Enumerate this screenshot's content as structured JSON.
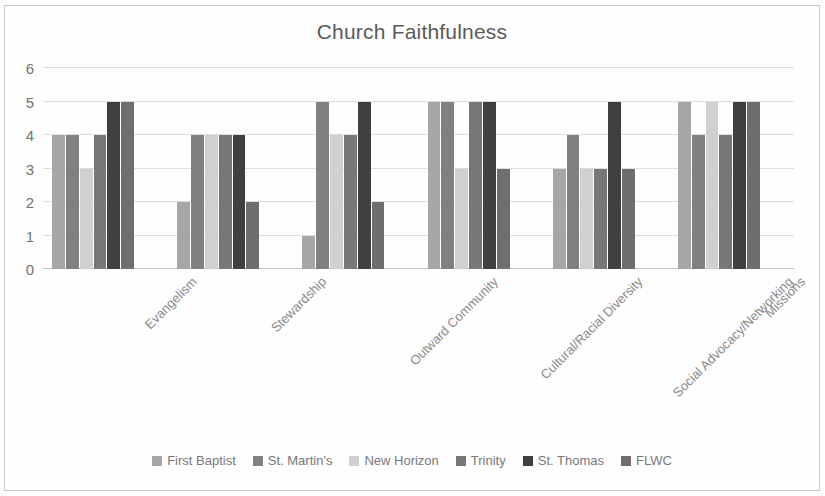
{
  "chart_data": {
    "type": "bar",
    "title": "Church Faithfulness",
    "xlabel": "",
    "ylabel": "",
    "ylim": [
      0,
      6
    ],
    "yticks": [
      0,
      1,
      2,
      3,
      4,
      5,
      6
    ],
    "grid": true,
    "legend_position": "bottom",
    "categories": [
      "Evangelism",
      "Stewardship",
      "Outward Community",
      "Cultural/Racial Diversity",
      "Social Advocacy/Networking",
      "Missions"
    ],
    "series": [
      {
        "name": "First Baptist",
        "color": "#a6a6a6",
        "values": [
          4,
          2,
          1,
          5,
          3,
          5
        ]
      },
      {
        "name": "St. Martin's",
        "color": "#808080",
        "values": [
          4,
          4,
          5,
          5,
          4,
          4
        ]
      },
      {
        "name": "New Horizon",
        "color": "#d0d0d0",
        "values": [
          3,
          4,
          4,
          3,
          3,
          5
        ]
      },
      {
        "name": "Trinity",
        "color": "#777777",
        "values": [
          4,
          4,
          4,
          5,
          3,
          4
        ]
      },
      {
        "name": "St. Thomas",
        "color": "#404040",
        "values": [
          5,
          4,
          5,
          5,
          5,
          5
        ]
      },
      {
        "name": "FLWC",
        "color": "#6e6e6e",
        "values": [
          5,
          2,
          2,
          3,
          3,
          5
        ]
      }
    ]
  },
  "legend": {
    "items": [
      {
        "label": "First Baptist"
      },
      {
        "label": "St. Martin's"
      },
      {
        "label": "New Horizon"
      },
      {
        "label": "Trinity"
      },
      {
        "label": "St. Thomas"
      },
      {
        "label": "FLWC"
      }
    ]
  }
}
